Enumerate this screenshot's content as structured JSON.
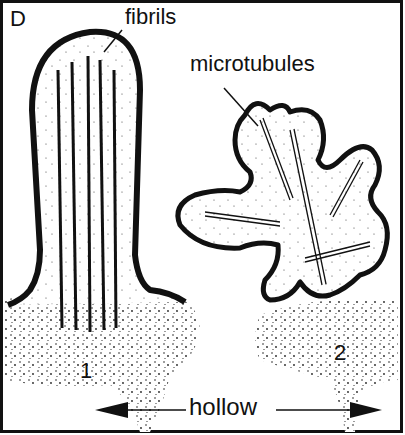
{
  "figure": {
    "panel_label": "D",
    "labels": {
      "fibrils": "fibrils",
      "microtubules": "microtubules",
      "hollow": "hollow",
      "structure_1": "1",
      "structure_2": "2"
    },
    "colors": {
      "ink": "#111111",
      "background": "#ffffff"
    }
  }
}
